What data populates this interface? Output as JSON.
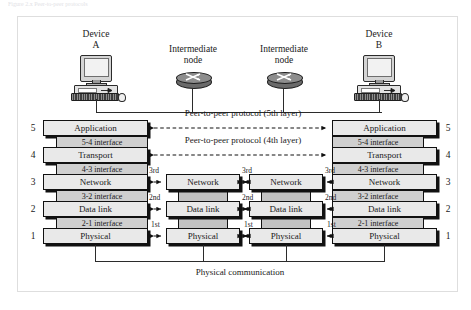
{
  "caption": "Figure 2.x  Peer-to-peer protocols",
  "devices": [
    {
      "name": "device-a",
      "label_line1": "Device",
      "label_line2": "A",
      "icon": "desktop-computer-icon"
    },
    {
      "name": "device-b",
      "label_line1": "Device",
      "label_line2": "B",
      "icon": "desktop-computer-icon"
    }
  ],
  "intermediate_nodes": [
    {
      "name": "intermediate-node-1",
      "label_line1": "Intermediate",
      "label_line2": "node",
      "icon": "router-icon"
    },
    {
      "name": "intermediate-node-2",
      "label_line1": "Intermediate",
      "label_line2": "node",
      "icon": "router-icon"
    }
  ],
  "layer_numbers": [
    "5",
    "4",
    "3",
    "2",
    "1"
  ],
  "end_stack": {
    "layers": [
      "Application",
      "Transport",
      "Network",
      "Data link",
      "Physical"
    ],
    "interfaces": [
      "5-4 interface",
      "4-3 interface",
      "3-2 interface",
      "2-1 interface"
    ]
  },
  "intermediate_stack": {
    "layers": [
      "Network",
      "Data link",
      "Physical"
    ]
  },
  "peer_protocols": [
    "Peer-to-peer protocol (5th layer)",
    "Peer-to-peer protocol (4th layer)"
  ],
  "hop_labels": {
    "network": "3rd",
    "datalink": "2nd",
    "physical": "1st"
  },
  "physical_communication_label": "Physical communication",
  "colors": {
    "layer_fill": "#e9e9e9",
    "interface_fill": "#cfcfcf",
    "connector_fill": "#c2c2c2",
    "stroke": "#111111",
    "frame": "#dedede",
    "background": "#ffffff"
  }
}
